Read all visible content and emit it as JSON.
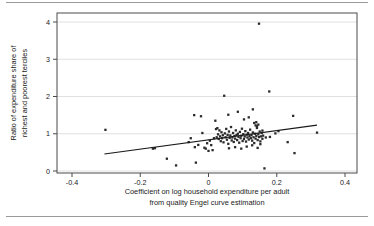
{
  "figure": {
    "background_color": "#ffffff",
    "rule_color": "#9a9a9a",
    "has_top_rule": true,
    "has_bottom_rule": true
  },
  "chart_data": {
    "type": "scatter",
    "title": "",
    "subtitle": "",
    "xlabel": "Coefficient on log household expenditure per adult from quality Engel curve estimation",
    "xlabel_lines": [
      "Coefficient on log household expenditure per adult",
      "from quality Engel curve estimation"
    ],
    "ylabel": "Ratio of expenditure share of richest and poorest terciles",
    "ylabel_lines": [
      "Ratio of expenditure share of",
      "richest and poorest terciles"
    ],
    "xlim": [
      -0.4,
      0.4
    ],
    "ylim": [
      -0.15,
      4.15
    ],
    "xticks": [
      -0.4,
      -0.2,
      0,
      0.2,
      0.4
    ],
    "xtick_labels": [
      "-0.4",
      "-0.2",
      "0",
      "0.2",
      "0.4"
    ],
    "yticks": [
      0,
      1,
      2,
      3,
      4
    ],
    "ytick_labels": [
      "0",
      "1",
      "2",
      "3",
      "4"
    ],
    "grid": "horizontal",
    "grid_color": "#d8d8d8",
    "frame_color": "#4a4a4a",
    "legend": null,
    "marker": {
      "shape": "square",
      "size_px": 2.3,
      "color": "#2b2b2b"
    },
    "fit_line": {
      "label": "linear fit",
      "color": "#1a1a1a",
      "width_px": 1.1,
      "x_start": -0.305,
      "y_start": 0.455,
      "x_end": 0.318,
      "y_end": 1.232
    },
    "points": [
      [
        -0.302,
        1.105
      ],
      [
        -0.163,
        0.6
      ],
      [
        -0.157,
        0.612
      ],
      [
        -0.122,
        0.33
      ],
      [
        -0.095,
        0.15
      ],
      [
        -0.058,
        0.775
      ],
      [
        -0.052,
        0.88
      ],
      [
        -0.042,
        1.5
      ],
      [
        -0.04,
        0.64
      ],
      [
        -0.037,
        0.225
      ],
      [
        -0.03,
        0.7
      ],
      [
        -0.022,
        1.47
      ],
      [
        -0.018,
        1.02
      ],
      [
        -0.012,
        0.625
      ],
      [
        -0.008,
        0.6
      ],
      [
        -0.004,
        0.745
      ],
      [
        0.0,
        0.54
      ],
      [
        0.004,
        0.815
      ],
      [
        0.008,
        0.695
      ],
      [
        0.012,
        0.56
      ],
      [
        0.016,
        0.88
      ],
      [
        0.02,
        1.35
      ],
      [
        0.022,
        1.125
      ],
      [
        0.024,
        0.905
      ],
      [
        0.026,
        1.15
      ],
      [
        0.028,
        0.985
      ],
      [
        0.03,
        0.86
      ],
      [
        0.032,
        1.09
      ],
      [
        0.034,
        0.93
      ],
      [
        0.036,
        0.8
      ],
      [
        0.038,
        1.04
      ],
      [
        0.04,
        0.88
      ],
      [
        0.042,
        0.96
      ],
      [
        0.044,
        0.77
      ],
      [
        0.046,
        2.02
      ],
      [
        0.048,
        1.01
      ],
      [
        0.05,
        0.905
      ],
      [
        0.052,
        1.13
      ],
      [
        0.054,
        0.84
      ],
      [
        0.056,
        0.97
      ],
      [
        0.058,
        0.73
      ],
      [
        0.06,
        1.06
      ],
      [
        0.062,
        0.89
      ],
      [
        0.064,
        0.955
      ],
      [
        0.066,
        1.18
      ],
      [
        0.068,
        0.82
      ],
      [
        0.07,
        0.9
      ],
      [
        0.072,
        1.02
      ],
      [
        0.074,
        0.78
      ],
      [
        0.076,
        0.94
      ],
      [
        0.078,
        0.87
      ],
      [
        0.08,
        1.09
      ],
      [
        0.082,
        0.965
      ],
      [
        0.084,
        0.83
      ],
      [
        0.086,
        1.0
      ],
      [
        0.088,
        0.915
      ],
      [
        0.09,
        0.76
      ],
      [
        0.092,
        1.05
      ],
      [
        0.094,
        0.88
      ],
      [
        0.096,
        0.945
      ],
      [
        0.098,
        1.135
      ],
      [
        0.1,
        0.805
      ],
      [
        0.102,
        0.99
      ],
      [
        0.104,
        0.86
      ],
      [
        0.106,
        0.925
      ],
      [
        0.108,
        1.07
      ],
      [
        0.11,
        0.79
      ],
      [
        0.112,
        0.975
      ],
      [
        0.114,
        0.9
      ],
      [
        0.116,
        1.02
      ],
      [
        0.118,
        0.845
      ],
      [
        0.12,
        0.935
      ],
      [
        0.122,
        1.11
      ],
      [
        0.124,
        0.88
      ],
      [
        0.126,
        0.96
      ],
      [
        0.128,
        0.815
      ],
      [
        0.13,
        1.035
      ],
      [
        0.132,
        0.905
      ],
      [
        0.134,
        0.75
      ],
      [
        0.136,
        1.0
      ],
      [
        0.138,
        0.87
      ],
      [
        0.14,
        0.945
      ],
      [
        0.142,
        1.2
      ],
      [
        0.144,
        0.83
      ],
      [
        0.146,
        0.985
      ],
      [
        0.148,
        0.91
      ],
      [
        0.15,
        1.06
      ],
      [
        0.152,
        0.795
      ],
      [
        0.154,
        0.93
      ],
      [
        0.156,
        1.02
      ],
      [
        0.158,
        0.865
      ],
      [
        0.16,
        0.95
      ],
      [
        0.058,
        1.51
      ],
      [
        0.086,
        1.59
      ],
      [
        0.104,
        1.385
      ],
      [
        0.118,
        1.44
      ],
      [
        0.13,
        1.655
      ],
      [
        0.134,
        1.29
      ],
      [
        0.138,
        1.225
      ],
      [
        0.14,
        1.31
      ],
      [
        0.142,
        1.155
      ],
      [
        0.146,
        1.245
      ],
      [
        0.148,
        3.955
      ],
      [
        0.06,
        0.61
      ],
      [
        0.078,
        0.64
      ],
      [
        0.096,
        0.6
      ],
      [
        0.112,
        0.655
      ],
      [
        0.128,
        0.69
      ],
      [
        0.144,
        0.62
      ],
      [
        0.152,
        0.72
      ],
      [
        0.158,
        1.085
      ],
      [
        0.164,
        0.07
      ],
      [
        0.168,
        0.9
      ],
      [
        0.178,
        2.135
      ],
      [
        0.18,
        0.915
      ],
      [
        0.196,
        1.01
      ],
      [
        0.205,
        1.07
      ],
      [
        0.232,
        0.775
      ],
      [
        0.248,
        1.48
      ],
      [
        0.252,
        0.48
      ],
      [
        0.318,
        1.03
      ]
    ]
  }
}
